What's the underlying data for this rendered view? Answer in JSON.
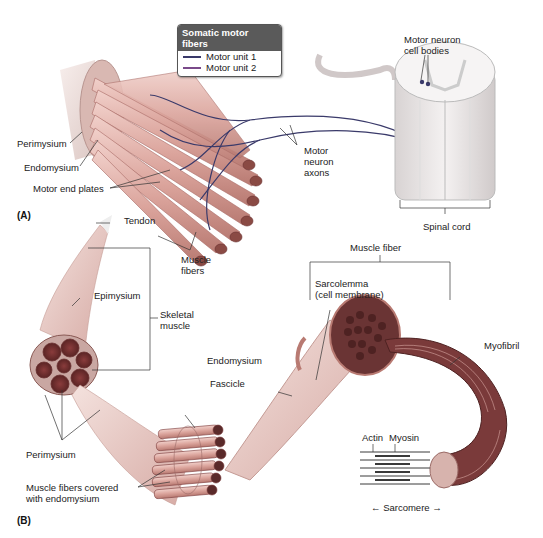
{
  "legend": {
    "title": "Somatic motor fibers",
    "items": [
      {
        "label": "Motor unit 1",
        "color": "#3a3a6a"
      },
      {
        "label": "Motor unit 2",
        "color": "#7a4a8a"
      }
    ]
  },
  "panel_a": {
    "tag": "(A)",
    "labels": {
      "perimysium": "Perimysium",
      "endomysium": "Endomysium",
      "motor_end_plates": "Motor end plates",
      "motor_neuron_axons_1": "Motor",
      "motor_neuron_axons_2": "neuron",
      "motor_neuron_axons_3": "axons",
      "motor_neuron_cell_bodies_1": "Motor neuron",
      "motor_neuron_cell_bodies_2": "cell bodies",
      "muscle_fibers_1": "Muscle",
      "muscle_fibers_2": "fibers",
      "spinal_cord": "Spinal cord"
    }
  },
  "panel_b": {
    "tag": "(B)",
    "labels": {
      "tendon": "Tendon",
      "epimysium": "Epimysium",
      "skeletal_muscle_1": "Skeletal",
      "skeletal_muscle_2": "muscle",
      "perimysium": "Perimysium",
      "muscle_fibers_covered_1": "Muscle fibers covered",
      "muscle_fibers_covered_2": "with endomysium",
      "fascicle": "Fascicle",
      "endomysium": "Endomysium",
      "muscle_fiber": "Muscle fiber",
      "sarcolemma_1": "Sarcolemma",
      "sarcolemma_2": "(cell membrane)",
      "myofibril": "Myofibril",
      "actin": "Actin",
      "myosin": "Myosin",
      "sarcomere": "← Sarcomere →"
    }
  },
  "colors": {
    "muscle_pink": "#e8b7b0",
    "muscle_dark": "#b86a66",
    "fiber_red": "#9b3a3a",
    "nerve": "#3a3a6a",
    "sheath": "#efe6e2",
    "spinal_cord": "#ece8e8"
  }
}
